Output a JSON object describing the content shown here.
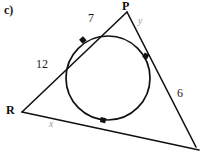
{
  "figure": {
    "part_label": "c)",
    "vertices": [
      {
        "name": "P",
        "label": "P",
        "x": 127,
        "y": 12
      },
      {
        "name": "R",
        "label": "R",
        "x": 22,
        "y": 112
      },
      {
        "name": "bottom-right",
        "label": "",
        "x": 196,
        "y": 147
      }
    ],
    "sides": [
      {
        "from": "R",
        "to": "P",
        "label": "12",
        "kind": "measure"
      },
      {
        "from": "P",
        "to": "R",
        "label": "7",
        "kind": "measure"
      },
      {
        "from": "P",
        "to": "bottom-right",
        "label": "y",
        "kind": "unknown"
      },
      {
        "from": "bottom-right",
        "to": "P",
        "label": "6",
        "kind": "measure"
      },
      {
        "from": "R",
        "to": "bottom-right",
        "label": "x",
        "kind": "unknown"
      }
    ],
    "labels": {
      "part": "c)",
      "vertex_p": "P",
      "vertex_r": "R",
      "seg_seven": "7",
      "seg_y": "y",
      "seg_twelve": "12",
      "seg_six": "6",
      "seg_x": "x"
    },
    "circle": {
      "center_x": 108,
      "center_y": 78,
      "radius": 42
    },
    "tangent_points": [
      {
        "name": "tangent-upper-left",
        "x": 83,
        "y": 40
      },
      {
        "name": "tangent-right",
        "x": 146,
        "y": 56
      },
      {
        "name": "tangent-bottom",
        "x": 103,
        "y": 120
      }
    ],
    "colors": {
      "ink": "#111111",
      "faint_ink": "#9a9a9a",
      "paper": "#ffffff"
    }
  }
}
